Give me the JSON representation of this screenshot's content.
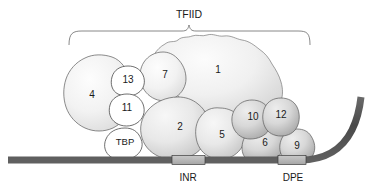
{
  "figure": {
    "title_label": "TFIID",
    "kind": "molecular-complex-schematic",
    "canvas": {
      "width": 376,
      "height": 187
    }
  },
  "complex": {
    "name": "TFIID",
    "bracket_label": "TFIID",
    "bracket_span_px": {
      "x_start": 68,
      "x_end": 310,
      "y": 30
    }
  },
  "subunits": [
    {
      "id": "taf4",
      "label": "4",
      "cx": 92,
      "cy": 95,
      "style": "light-oval"
    },
    {
      "id": "taf13",
      "label": "13",
      "cx": 128,
      "cy": 80,
      "style": "white-circle"
    },
    {
      "id": "taf11",
      "label": "11",
      "cx": 127,
      "cy": 108,
      "style": "white-circle"
    },
    {
      "id": "tbp",
      "label": "TBP",
      "cx": 125,
      "cy": 142,
      "style": "white-circle"
    },
    {
      "id": "taf7",
      "label": "7",
      "cx": 165,
      "cy": 75,
      "style": "light-blob"
    },
    {
      "id": "taf1",
      "label": "1",
      "cx": 218,
      "cy": 70,
      "style": "large-lobed-blob"
    },
    {
      "id": "taf2",
      "label": "2",
      "cx": 180,
      "cy": 127,
      "style": "mid-blob"
    },
    {
      "id": "taf5",
      "label": "5",
      "cx": 222,
      "cy": 135,
      "style": "mid-blob"
    },
    {
      "id": "taf10",
      "label": "10",
      "cx": 253,
      "cy": 117,
      "style": "dark-blob"
    },
    {
      "id": "taf12",
      "label": "12",
      "cx": 281,
      "cy": 115,
      "style": "dark-blob"
    },
    {
      "id": "taf6",
      "label": "6",
      "cx": 265,
      "cy": 143,
      "style": "dark-blob"
    },
    {
      "id": "taf9",
      "label": "9",
      "cx": 297,
      "cy": 146,
      "style": "dark-blob"
    }
  ],
  "dna": {
    "description": "promoter-dna-strand",
    "baseline_y": 160,
    "left_end_x": 8,
    "bend_start_x": 305,
    "right_top": {
      "x": 361,
      "y": 97
    },
    "color": "#4f4f4f",
    "thickness_px": 7
  },
  "promoter_elements": [
    {
      "id": "inr",
      "label": "INR",
      "box_x": 172,
      "box_w": 33,
      "label_cx": 188,
      "label_cy": 178,
      "fill": "#b4b4b4"
    },
    {
      "id": "dpe",
      "label": "DPE",
      "box_x": 278,
      "box_w": 28,
      "label_cx": 293,
      "label_cy": 178,
      "fill": "#b4b4b4"
    }
  ],
  "colors": {
    "background": "#ffffff",
    "outline": "#5a5a5a",
    "text": "#1a1a1a",
    "dna": "#4f4f4f",
    "element_box": "#b4b4b4",
    "blob_light_center": "#fbfbfb",
    "blob_light_edge": "#dcdcdc",
    "blob_mid_center": "#f2f2f2",
    "blob_mid_edge": "#c8c8c8",
    "blob_dark_center": "#e2e2e2",
    "blob_dark_edge": "#a9a9a9"
  }
}
